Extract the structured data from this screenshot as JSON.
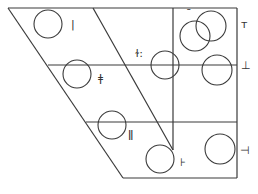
{
  "diagram": {
    "type": "trapezoid-grid-with-circles",
    "stroke_color": "#3a3a3a",
    "background": "#ffffff",
    "labels": [
      {
        "id": "l1",
        "text": "|",
        "x": 71,
        "y": 19
      },
      {
        "id": "l2",
        "text": "ǂ",
        "x": 98,
        "y": 73
      },
      {
        "id": "l3",
        "text": "ɫ:",
        "x": 135,
        "y": 48
      },
      {
        "id": "l4",
        "text": "ˉ",
        "x": 186,
        "y": 8
      },
      {
        "id": "l5",
        "text": "ᴛ",
        "x": 241,
        "y": 19
      },
      {
        "id": "l6",
        "text": "⊥",
        "x": 241,
        "y": 60
      },
      {
        "id": "l7",
        "text": "ǁ",
        "x": 128,
        "y": 129
      },
      {
        "id": "l8",
        "text": "⊦",
        "x": 180,
        "y": 157
      },
      {
        "id": "l9",
        "text": "⊣",
        "x": 240,
        "y": 145
      }
    ],
    "circles": [
      {
        "id": "c1",
        "cx": 48,
        "cy": 24,
        "r": 14
      },
      {
        "id": "c2",
        "cx": 77,
        "cy": 74,
        "r": 14
      },
      {
        "id": "c3",
        "cx": 112,
        "cy": 125,
        "r": 14
      },
      {
        "id": "c4",
        "cx": 160,
        "cy": 159,
        "r": 14
      },
      {
        "id": "c5",
        "cx": 165,
        "cy": 65,
        "r": 14
      },
      {
        "id": "c6",
        "cx": 195,
        "cy": 36,
        "r": 15
      },
      {
        "id": "c7",
        "cx": 211,
        "cy": 26,
        "r": 15
      },
      {
        "id": "c8",
        "cx": 217,
        "cy": 70,
        "r": 15
      },
      {
        "id": "c9",
        "cx": 220,
        "cy": 149,
        "r": 15
      }
    ]
  }
}
